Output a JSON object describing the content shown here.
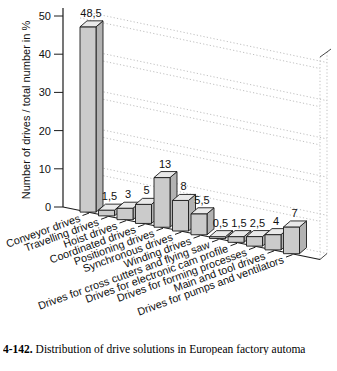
{
  "figure": {
    "caption_number": "4-142.",
    "caption_text": " Distribution of drive solutions in European factory automa"
  },
  "chart_data": {
    "type": "bar",
    "style": "3d-oblique-columns",
    "title": "",
    "xlabel": "",
    "ylabel": "Number of drives / total number in %",
    "ylim": [
      0,
      50
    ],
    "yticks": [
      0,
      10,
      20,
      30,
      40,
      50
    ],
    "grid": "dotted",
    "legend": "none",
    "decimal_separator": ",",
    "categories": [
      "Conveyor drives",
      "Travelling drives",
      "Hoist drives",
      "Coordinated drives",
      "Positioning drives",
      "Synchronous drives",
      "Winding drives",
      "Drives for cross cutters and flying saw",
      "Drives for electronic cam profile",
      "Drives for forming processes",
      "Main and tool drives",
      "Drives for pumps and ventilators"
    ],
    "values": [
      48.5,
      1.5,
      3,
      5,
      13,
      8,
      5.5,
      0.5,
      1.5,
      2.5,
      4,
      7
    ],
    "value_labels": [
      "48,5",
      "1,5",
      "3",
      "5",
      "13",
      "8",
      "5,5",
      "0,5",
      "1,5",
      "2,5",
      "4",
      "7"
    ],
    "colors": {
      "bar_front": "#cbcbcb",
      "bar_top": "#e9e9e9",
      "bar_side": "#b2b2b2",
      "outline": "#1c1c1c",
      "grid": "#b9b9b9",
      "text": "#111111"
    }
  }
}
